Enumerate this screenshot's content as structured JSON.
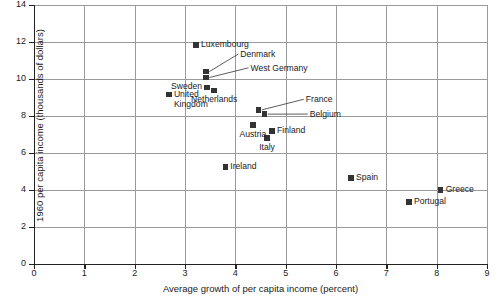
{
  "chart_data": {
    "type": "scatter",
    "title": "",
    "xlabel": "Average growth of per capita income (percent)",
    "ylabel": "1960 per capita income (thousands of dollars)",
    "xlim": [
      0,
      9
    ],
    "ylim": [
      0,
      14
    ],
    "xticks": [
      "0",
      "1",
      "2",
      "3",
      "4",
      "5",
      "6",
      "7",
      "8",
      "9"
    ],
    "yticks": [
      "0",
      "2",
      "4",
      "6",
      "8",
      "10",
      "12",
      "14"
    ],
    "grid": true,
    "legend": "none",
    "marker_color": "#333333",
    "points": [
      {
        "label": "Luxembourg",
        "x": 3.22,
        "y": 11.85,
        "label_pos": "right",
        "leader": false
      },
      {
        "label": "Denmark",
        "x": 3.42,
        "y": 10.4,
        "label_pos": "leader",
        "leader": true,
        "label_x": 4.1,
        "label_y": 11.3
      },
      {
        "label": "West Germany",
        "x": 3.42,
        "y": 10.08,
        "label_pos": "leader",
        "leader": true,
        "label_x": 4.3,
        "label_y": 10.55
      },
      {
        "label": "Sweden",
        "x": 3.44,
        "y": 9.55,
        "label_pos": "left",
        "leader": false
      },
      {
        "label": "Netherlands",
        "x": 3.58,
        "y": 9.38,
        "label_pos": "below",
        "leader": false
      },
      {
        "label": "United\nKingdom",
        "x": 2.68,
        "y": 9.15,
        "label_pos": "right",
        "leader": false
      },
      {
        "label": "France",
        "x": 4.46,
        "y": 8.33,
        "label_pos": "leader",
        "leader": true,
        "label_x": 5.4,
        "label_y": 8.85
      },
      {
        "label": "Belgium",
        "x": 4.58,
        "y": 8.1,
        "label_pos": "leader",
        "leader": true,
        "label_x": 5.48,
        "label_y": 8.05
      },
      {
        "label": "Austria",
        "x": 4.35,
        "y": 7.52,
        "label_pos": "below",
        "leader": false
      },
      {
        "label": "Finland",
        "x": 4.73,
        "y": 7.18,
        "label_pos": "right",
        "leader": false
      },
      {
        "label": "Italy",
        "x": 4.63,
        "y": 6.8,
        "label_pos": "below",
        "leader": false
      },
      {
        "label": "Ireland",
        "x": 3.8,
        "y": 5.25,
        "label_pos": "right",
        "leader": false
      },
      {
        "label": "Spain",
        "x": 6.3,
        "y": 4.65,
        "label_pos": "right",
        "leader": false
      },
      {
        "label": "Greece",
        "x": 8.08,
        "y": 4.0,
        "label_pos": "right",
        "leader": false
      },
      {
        "label": "Portugal",
        "x": 7.45,
        "y": 3.35,
        "label_pos": "right",
        "leader": false
      }
    ]
  }
}
